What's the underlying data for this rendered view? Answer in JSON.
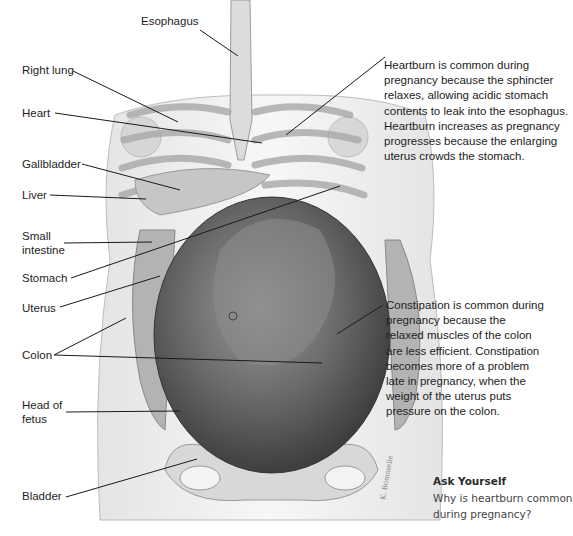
{
  "figure": {
    "labels": [
      {
        "id": "esophagus",
        "text": "Esophagus",
        "x": 141,
        "y": 21
      },
      {
        "id": "right-lung",
        "text": "Right lung",
        "x": 22,
        "y": 65
      },
      {
        "id": "heart",
        "text": "Heart",
        "x": 22,
        "y": 107
      },
      {
        "id": "gallbladder",
        "text": "Gallbladder",
        "x": 22,
        "y": 157
      },
      {
        "id": "liver",
        "text": "Liver",
        "x": 22,
        "y": 188
      },
      {
        "id": "small-intestine",
        "text": "Small\nintestine",
        "x": 22,
        "y": 230
      },
      {
        "id": "stomach",
        "text": "Stomach",
        "x": 22,
        "y": 272
      },
      {
        "id": "uterus",
        "text": "Uterus",
        "x": 22,
        "y": 302
      },
      {
        "id": "colon",
        "text": "Colon",
        "x": 22,
        "y": 349
      },
      {
        "id": "head-of-fetus",
        "text": "Head of\nfetus",
        "x": 22,
        "y": 398
      },
      {
        "id": "bladder",
        "text": "Bladder",
        "x": 22,
        "y": 490
      }
    ],
    "notes": {
      "heartburn": "Heartburn is common during pregnancy because the sphincter relaxes, allowing acidic stomach contents to leak into the esophagus. Heartburn increases as pregnancy progresses because the enlarging uterus crowds the stomach.",
      "constipation": "Constipation is common during pregnancy because the relaxed muscles of the colon are less efficient. Constipation becomes more of a problem late in pregnancy, when the weight of the uterus puts pressure on the colon."
    },
    "ask_yourself": {
      "title": "Ask Yourself",
      "question": "Why is heartburn common during pregnancy?"
    },
    "colors": {
      "leader_line": "#1a1a1a",
      "body_fill": "#f1f1f1",
      "uterus_fill": "#5c5c5c",
      "text": "#1e1e1e"
    }
  }
}
